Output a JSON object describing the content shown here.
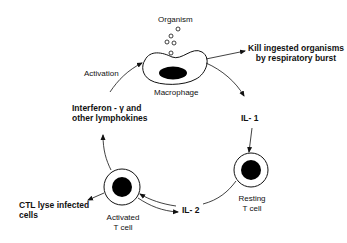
{
  "diagram": {
    "nodes": {
      "organism": {
        "label": "Organism"
      },
      "macrophage": {
        "label": "Macrophage"
      },
      "resting_t_cell": {
        "line1": "Resting",
        "line2": "T cell"
      },
      "activated_t_cell": {
        "line1": "Activated",
        "line2": "T cell"
      }
    },
    "labels": {
      "kill": {
        "line1": "Kill ingested organisms",
        "line2": "by respiratory burst"
      },
      "il1": "IL- 1",
      "il2": "IL- 2",
      "ctl": {
        "line1": "CTL lyse infected",
        "line2": "cells"
      },
      "interferon": {
        "line1": "Interferon - γ and",
        "line2": "other lymphokines"
      },
      "activation": "Activation"
    },
    "colors": {
      "stroke": "#111111",
      "fill_nucleus": "#000000",
      "background": "#ffffff"
    }
  }
}
